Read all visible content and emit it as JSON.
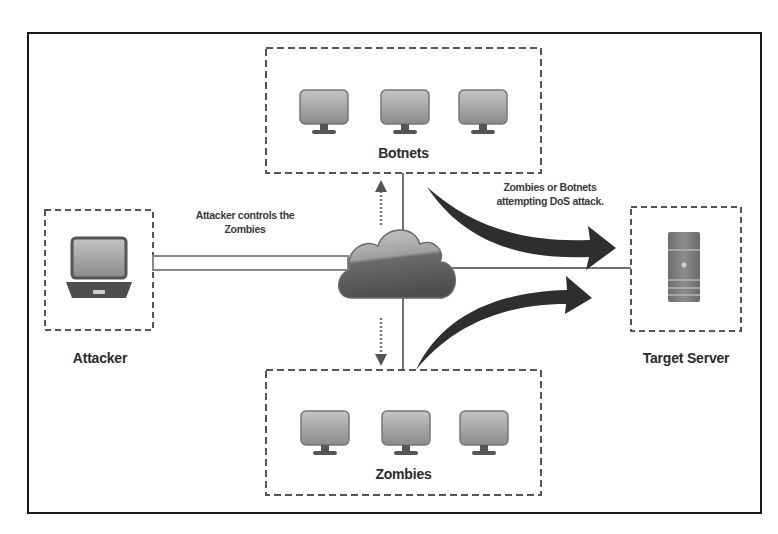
{
  "diagram": {
    "title": "",
    "nodes": {
      "botnets": {
        "label": "Botnets",
        "devices": [
          "monitor-icon",
          "monitor-icon",
          "monitor-icon"
        ]
      },
      "zombies": {
        "label": "Zombies",
        "devices": [
          "monitor-icon",
          "monitor-icon",
          "monitor-icon"
        ]
      },
      "attacker": {
        "label": "Attacker",
        "device": "laptop-icon"
      },
      "target": {
        "label": "Target Server",
        "device": "server-icon"
      },
      "cloud": {
        "label": "",
        "icon": "cloud-icon"
      }
    },
    "annotations": {
      "control_line1": "Attacker controls the",
      "control_line2": "Zombies",
      "attack_line1": "Zombies or Botnets",
      "attack_line2": "attempting DoS attack."
    },
    "edges": [
      {
        "from": "attacker",
        "to": "cloud",
        "style": "double-line"
      },
      {
        "from": "cloud",
        "to": "botnets",
        "style": "dotted-arrow"
      },
      {
        "from": "cloud",
        "to": "zombies",
        "style": "dotted-arrow"
      },
      {
        "from": "cloud",
        "to": "target",
        "style": "solid-line"
      },
      {
        "from": "botnets",
        "to": "target",
        "style": "thick-curved-arrow"
      },
      {
        "from": "zombies",
        "to": "target",
        "style": "thick-curved-arrow"
      }
    ],
    "colors": {
      "frame": "#1a1a1a",
      "dash": "#555555",
      "arrow": "#2e2e2e",
      "cloud_top": "#b8b8b8",
      "cloud_bottom": "#5a5a5a",
      "monitor": "#9a9a9a",
      "text": "#2b2b2b"
    }
  }
}
